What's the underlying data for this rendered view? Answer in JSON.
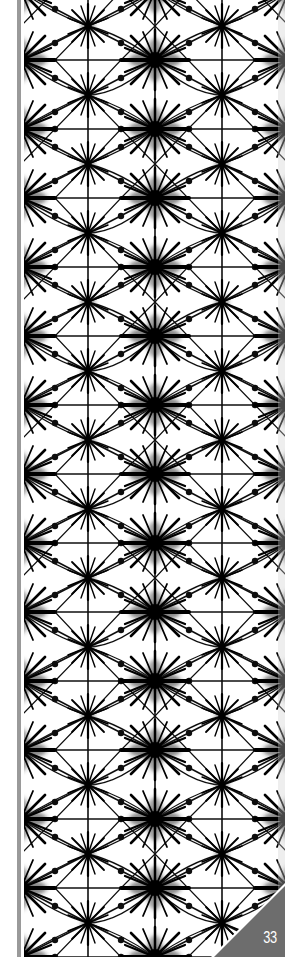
{
  "page": {
    "number": "33",
    "pattern": {
      "name": "shibori-star-grid",
      "colors": {
        "ink": "#111111",
        "background": "#ffffff"
      },
      "grid": {
        "x_lines": [
          88,
          155,
          222
        ],
        "row_spacing": 69,
        "first_row_y": 60
      }
    },
    "spine_stripe_color": "#9a9a9a",
    "corner_color": "#6d6d6d"
  }
}
